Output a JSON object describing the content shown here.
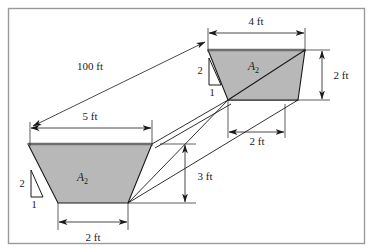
{
  "figure": {
    "type": "engineering-cross-section-diagram",
    "frame_color": "#9a9a9a",
    "fill_color": "#b8b8b8",
    "line_color": "#1a1a1a",
    "top_edge_color": "#6e6e6e"
  },
  "upper_section": {
    "area_label": "A",
    "area_subscript": "2",
    "top_width": "4 ft",
    "depth": "2 ft",
    "slope_rise": "2",
    "slope_run": "1"
  },
  "lower_section": {
    "area_label": "A",
    "area_subscript": "2",
    "top_width": "5 ft",
    "bottom_width": "2 ft",
    "slope_rise": "2",
    "slope_run": "1"
  },
  "dimensions": {
    "reach_length": "100 ft",
    "upper_top_width": "4 ft",
    "upper_depth": "2 ft",
    "lower_top_width": "5 ft",
    "lower_bottom_width": "2 ft",
    "offset_width": "2 ft",
    "drop_height": "3 ft"
  }
}
